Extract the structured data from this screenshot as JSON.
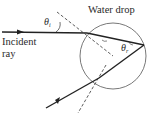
{
  "diagram": {
    "title_label": "Water drop",
    "incident_label_line1": "Incident",
    "incident_label_line2": "ray",
    "theta_i": "θ",
    "theta_i_sub": "i",
    "theta_r": "θ",
    "theta_r_sub": "r",
    "stroke_color": "#222222",
    "background": "#ffffff"
  }
}
